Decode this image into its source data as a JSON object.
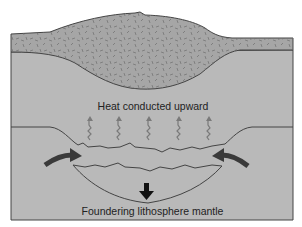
{
  "diagram": {
    "labels": {
      "heat": "Heat conducted upward",
      "foundering": "Foundering lithosphere mantle"
    },
    "colors": {
      "background": "#ffffff",
      "mantle_fill": "#b9b9b9",
      "crust_fill": "#a6a6a6",
      "outline": "#444444",
      "arrow_dark": "#3a3a3a",
      "heat_arrow": "#7a7a7a",
      "speckle": "#6e6e6e"
    },
    "elements": {
      "heat_arrows_count": 5,
      "side_arrows": [
        "left-inward",
        "right-inward"
      ],
      "down_arrow": "sinking"
    }
  }
}
